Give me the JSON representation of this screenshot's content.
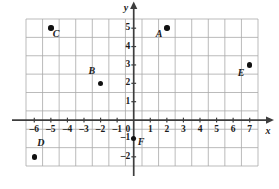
{
  "figure": {
    "type": "coordinate-plane",
    "background_color": "#ffffff",
    "grid_color": "#a9a9a9",
    "axis_color": "#3d3d3d",
    "point_color": "#111111"
  },
  "axes": {
    "x_axis_name": "x",
    "y_axis_name": "y",
    "origin_label": "0",
    "x_ticks": [
      "–6",
      "–5",
      "–4",
      "–3",
      "–2",
      "–1",
      "1",
      "2",
      "3",
      "4",
      "5",
      "6",
      "7"
    ],
    "y_ticks": [
      "5",
      "4",
      "3",
      "2",
      "1",
      "–1",
      "–2"
    ]
  },
  "chart_data": {
    "type": "scatter",
    "title": "",
    "xlabel": "x",
    "ylabel": "y",
    "xlim": [
      -6.5,
      7.5
    ],
    "ylim": [
      -2.5,
      5.5
    ],
    "grid": true,
    "legend": "none",
    "x_tick_values": [
      -6,
      -5,
      -4,
      -3,
      -2,
      -1,
      0,
      1,
      2,
      3,
      4,
      5,
      6,
      7
    ],
    "y_tick_values": [
      -2,
      -1,
      0,
      1,
      2,
      3,
      4,
      5
    ],
    "points": [
      {
        "label": "A",
        "x": 2,
        "y": 5,
        "label_dx": -11,
        "label_dy": 6
      },
      {
        "label": "B",
        "x": -2,
        "y": 2,
        "label_dx": -12,
        "label_dy": -12
      },
      {
        "label": "C",
        "x": -5,
        "y": 5,
        "label_dx": 2,
        "label_dy": 6
      },
      {
        "label": "D",
        "x": -6,
        "y": -2,
        "label_dx": 3,
        "label_dy": -14
      },
      {
        "label": "E",
        "x": 7,
        "y": 3,
        "label_dx": -12,
        "label_dy": 8
      },
      {
        "label": "F",
        "x": 0,
        "y": -1,
        "label_dx": 4,
        "label_dy": 4
      }
    ]
  }
}
